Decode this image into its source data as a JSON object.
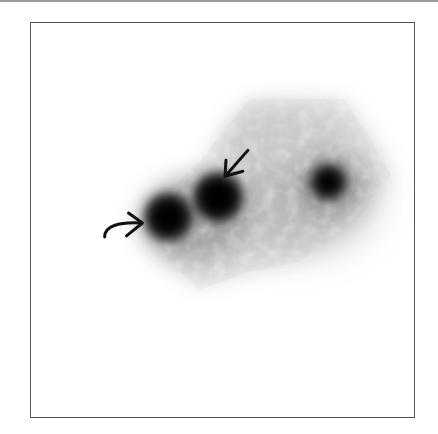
{
  "figure": {
    "type": "scintigraphy-image",
    "background": "#ffffff",
    "frame_color": "#555555",
    "foci": [
      {
        "name": "left-focus",
        "cx": 168,
        "cy": 217,
        "r": 20,
        "color": "#000000"
      },
      {
        "name": "middle-focus",
        "cx": 218,
        "cy": 197,
        "r": 21,
        "color": "#000000"
      },
      {
        "name": "right-focus",
        "cx": 329,
        "cy": 182,
        "r": 16,
        "color": "#000000"
      }
    ],
    "arrows": [
      {
        "name": "curved-arrow",
        "shape": "curved",
        "points_to": "left-focus",
        "direction": "right"
      },
      {
        "name": "straight-arrow",
        "shape": "straight",
        "points_to": "middle-focus",
        "direction": "down-left"
      }
    ]
  }
}
